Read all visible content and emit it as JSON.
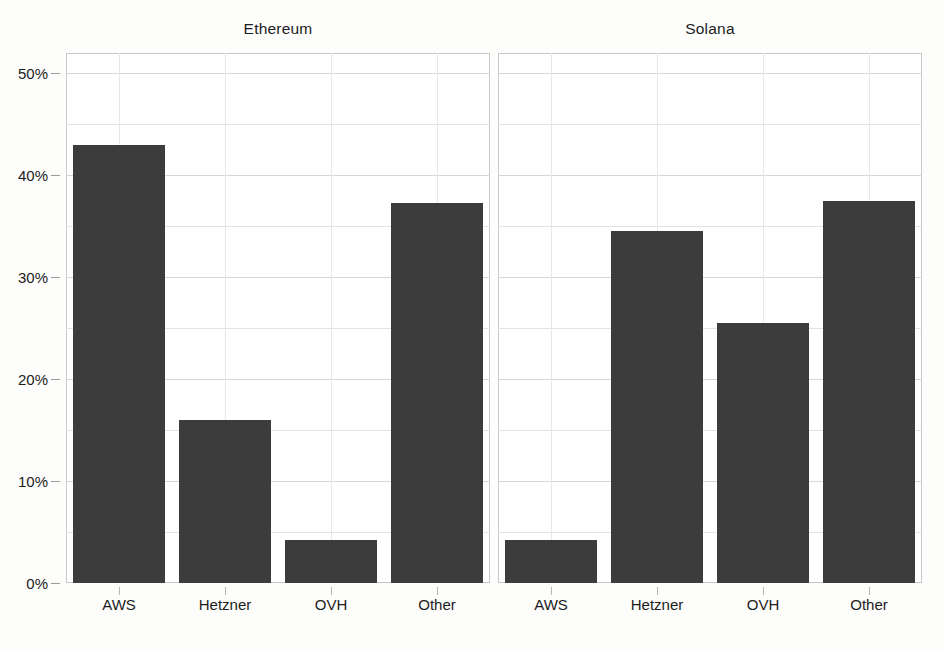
{
  "figure": {
    "background_color": "#ffffff",
    "bar_color": "#3c3c3c",
    "grid_color": "#e3e3e3",
    "axis_color": "#c9c9c9"
  },
  "chart_data": {
    "type": "bar",
    "title": "",
    "xlabel": "",
    "ylabel": "",
    "categories": [
      "AWS",
      "Hetzner",
      "OVH",
      "Other"
    ],
    "ylim": [
      0,
      52
    ],
    "yticks": [
      0,
      10,
      20,
      30,
      40,
      50
    ],
    "ytick_labels": [
      "0%",
      "10%",
      "20%",
      "30%",
      "40%",
      "50%"
    ],
    "minor_gridlines": [
      5,
      15,
      25,
      35,
      45
    ],
    "grid": true,
    "legend": "none",
    "panels": [
      {
        "title": "Ethereum",
        "categories": [
          "AWS",
          "Hetzner",
          "OVH",
          "Other"
        ],
        "values": [
          43.0,
          16.0,
          4.2,
          37.3
        ]
      },
      {
        "title": "Solana",
        "categories": [
          "AWS",
          "Hetzner",
          "OVH",
          "Other"
        ],
        "values": [
          4.2,
          34.5,
          25.5,
          37.5
        ]
      }
    ]
  }
}
